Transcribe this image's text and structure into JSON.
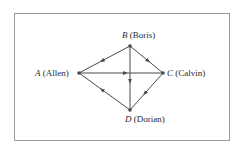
{
  "diagram": {
    "type": "directed-graph",
    "nodes": [
      {
        "id": "A",
        "letter": "A",
        "name": "(Allen)",
        "x": 79,
        "y": 73
      },
      {
        "id": "B",
        "letter": "B",
        "name": "(Boris)",
        "x": 130,
        "y": 46
      },
      {
        "id": "C",
        "letter": "C",
        "name": "(Calvin)",
        "x": 163,
        "y": 73
      },
      {
        "id": "D",
        "letter": "D",
        "name": "(Dorian)",
        "x": 130,
        "y": 110
      }
    ],
    "edges": [
      {
        "from": "B",
        "to": "A"
      },
      {
        "from": "B",
        "to": "C"
      },
      {
        "from": "A",
        "to": "C"
      },
      {
        "from": "B",
        "to": "D"
      },
      {
        "from": "C",
        "to": "D"
      },
      {
        "from": "D",
        "to": "A"
      }
    ],
    "colors": {
      "line": "#4a4a4a",
      "border": "#9a9a9a",
      "text": "#2a2a2a"
    }
  }
}
